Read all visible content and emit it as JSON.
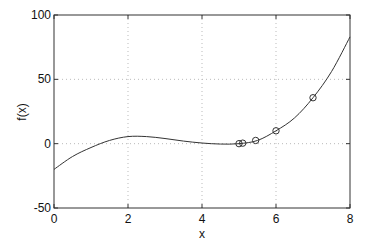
{
  "chart_data": {
    "type": "line",
    "title": "",
    "xlabel": "x",
    "ylabel": "f(x)",
    "xlim": [
      0,
      8
    ],
    "ylim": [
      -50,
      100
    ],
    "grid": true,
    "xticks": [
      "0",
      "2",
      "4",
      "6",
      "8"
    ],
    "yticks": [
      "-50",
      "0",
      "50",
      "100"
    ],
    "series": [
      {
        "name": "f(x)",
        "style": "line",
        "x": [
          0,
          0.5,
          1,
          1.5,
          2,
          2.5,
          3,
          3.5,
          4,
          4.5,
          5,
          5.5,
          6,
          6.5,
          7,
          7.5,
          8
        ],
        "values": [
          -20,
          -10,
          -3,
          2.5,
          5.5,
          5.5,
          4,
          2,
          0.5,
          -0.3,
          0,
          2.5,
          10,
          20,
          35.7,
          56,
          83
        ]
      },
      {
        "name": "iterates",
        "style": "markers-circle",
        "x": [
          7,
          6,
          5.45,
          5.1,
          5.0
        ],
        "values": [
          35.7,
          10,
          2.5,
          0.4,
          0
        ]
      }
    ]
  }
}
